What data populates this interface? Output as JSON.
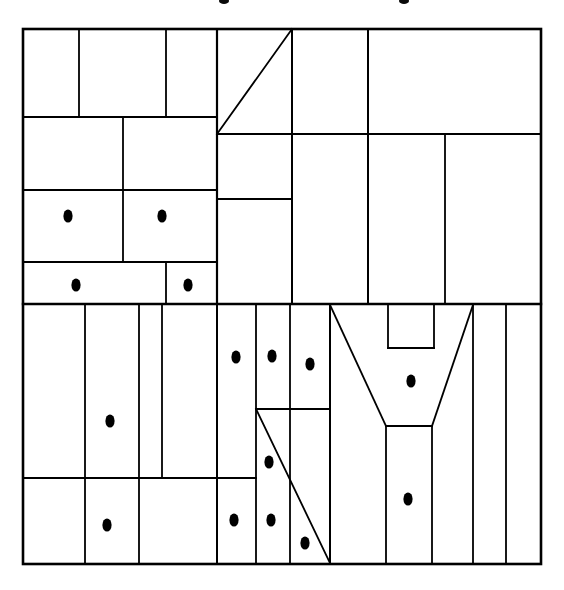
{
  "figure": {
    "title": "",
    "canvas": {
      "width": 564,
      "height": 590
    },
    "colors": {
      "background": "#ffffff",
      "line": "#000000",
      "marker": "#000000"
    },
    "line_weights": {
      "outer_border": 2.6,
      "major_partition": 2.2,
      "minor_partition": 1.6,
      "diagonal": 1.8
    },
    "plan_bounds": {
      "left": 23,
      "top": 29,
      "right": 541,
      "bottom": 564
    },
    "marker": {
      "shape": "ellipse",
      "semantic": "occupancy-dot",
      "radius_x": 4.6,
      "radius_y": 6.6,
      "count": 15
    },
    "top_artifacts": [
      {
        "name": "cropped-glyph-left",
        "cx": 224,
        "cy": 1,
        "rx": 5,
        "ry": 3
      },
      {
        "name": "cropped-glyph-right",
        "cx": 404,
        "cy": 1,
        "rx": 5,
        "ry": 3
      }
    ],
    "outer_border": {
      "x": 23,
      "y": 29,
      "width": 518,
      "height": 535
    },
    "walls": [
      {
        "name": "wall-h-upper-band-1",
        "x1": 23,
        "y1": 117,
        "x2": 217,
        "y2": 117,
        "w": 2.0
      },
      {
        "name": "wall-h-upper-band-2",
        "x1": 23,
        "y1": 190,
        "x2": 217,
        "y2": 190,
        "w": 2.0
      },
      {
        "name": "wall-h-upper-band-3",
        "x1": 23,
        "y1": 262,
        "x2": 217,
        "y2": 262,
        "w": 2.0
      },
      {
        "name": "wall-h-mid-major",
        "x1": 23,
        "y1": 304,
        "x2": 541,
        "y2": 304,
        "w": 2.4
      },
      {
        "name": "wall-v-tl-a",
        "x1": 79,
        "y1": 29,
        "x2": 79,
        "y2": 117,
        "w": 1.8
      },
      {
        "name": "wall-v-tl-b",
        "x1": 166,
        "y1": 29,
        "x2": 166,
        "y2": 117,
        "w": 1.8
      },
      {
        "name": "wall-v-tl-c",
        "x1": 217,
        "y1": 29,
        "x2": 217,
        "y2": 304,
        "w": 2.2
      },
      {
        "name": "wall-v-tl-d",
        "x1": 123,
        "y1": 117,
        "x2": 123,
        "y2": 262,
        "w": 1.8
      },
      {
        "name": "wall-v-tl-e",
        "x1": 166,
        "y1": 262,
        "x2": 166,
        "y2": 304,
        "w": 1.8
      },
      {
        "name": "wall-v-top-center",
        "x1": 292,
        "y1": 29,
        "x2": 292,
        "y2": 304,
        "w": 2.0
      },
      {
        "name": "wall-v-top-right-a",
        "x1": 368,
        "y1": 29,
        "x2": 368,
        "y2": 304,
        "w": 2.0
      },
      {
        "name": "wall-v-top-right-b",
        "x1": 445,
        "y1": 134,
        "x2": 445,
        "y2": 304,
        "w": 1.8
      },
      {
        "name": "wall-h-top-center-1",
        "x1": 217,
        "y1": 134,
        "x2": 541,
        "y2": 134,
        "w": 2.0
      },
      {
        "name": "wall-h-top-center-2",
        "x1": 217,
        "y1": 199,
        "x2": 292,
        "y2": 199,
        "w": 1.8
      },
      {
        "name": "wall-v-bl-a",
        "x1": 85,
        "y1": 304,
        "x2": 85,
        "y2": 564,
        "w": 1.8
      },
      {
        "name": "wall-v-bl-b",
        "x1": 139,
        "y1": 304,
        "x2": 139,
        "y2": 478,
        "w": 1.8
      },
      {
        "name": "wall-v-bl-c",
        "x1": 162,
        "y1": 304,
        "x2": 162,
        "y2": 478,
        "w": 1.8
      },
      {
        "name": "wall-v-bl-d",
        "x1": 139,
        "y1": 478,
        "x2": 139,
        "y2": 564,
        "w": 1.8
      },
      {
        "name": "wall-h-bl-lower",
        "x1": 23,
        "y1": 478,
        "x2": 217,
        "y2": 478,
        "w": 2.0
      },
      {
        "name": "wall-v-bc-a",
        "x1": 217,
        "y1": 304,
        "x2": 217,
        "y2": 564,
        "w": 2.0
      },
      {
        "name": "wall-v-bc-b",
        "x1": 256,
        "y1": 304,
        "x2": 256,
        "y2": 564,
        "w": 1.8
      },
      {
        "name": "wall-v-bc-c",
        "x1": 290,
        "y1": 304,
        "x2": 290,
        "y2": 564,
        "w": 1.8
      },
      {
        "name": "wall-h-bc-1",
        "x1": 256,
        "y1": 409,
        "x2": 330,
        "y2": 409,
        "w": 1.8
      },
      {
        "name": "wall-h-bc-2",
        "x1": 217,
        "y1": 478,
        "x2": 256,
        "y2": 478,
        "w": 1.8
      },
      {
        "name": "wall-v-bc-d",
        "x1": 330,
        "y1": 304,
        "x2": 330,
        "y2": 564,
        "w": 2.0
      },
      {
        "name": "wall-v-br-notch-left",
        "x1": 388,
        "y1": 304,
        "x2": 388,
        "y2": 348,
        "w": 1.8
      },
      {
        "name": "wall-v-br-notch-right",
        "x1": 434,
        "y1": 304,
        "x2": 434,
        "y2": 348,
        "w": 1.8
      },
      {
        "name": "wall-h-br-notch-bottom",
        "x1": 388,
        "y1": 348,
        "x2": 434,
        "y2": 348,
        "w": 1.8
      },
      {
        "name": "wall-h-br-stem-top",
        "x1": 386,
        "y1": 426,
        "x2": 432,
        "y2": 426,
        "w": 1.8
      },
      {
        "name": "wall-v-br-stem-left",
        "x1": 386,
        "y1": 426,
        "x2": 386,
        "y2": 564,
        "w": 1.8
      },
      {
        "name": "wall-v-br-stem-right",
        "x1": 432,
        "y1": 426,
        "x2": 432,
        "y2": 564,
        "w": 1.8
      },
      {
        "name": "wall-v-br-a",
        "x1": 473,
        "y1": 304,
        "x2": 473,
        "y2": 564,
        "w": 1.8
      },
      {
        "name": "wall-v-br-b",
        "x1": 506,
        "y1": 304,
        "x2": 506,
        "y2": 564,
        "w": 1.8
      }
    ],
    "diagonals": [
      {
        "name": "diagonal-top-triangle",
        "x1": 217,
        "y1": 134,
        "x2": 292,
        "y2": 29,
        "w": 1.8
      },
      {
        "name": "diagonal-bottom-long",
        "x1": 256,
        "y1": 409,
        "x2": 330,
        "y2": 563,
        "w": 1.8
      },
      {
        "name": "diagonal-funnel-left",
        "x1": 330,
        "y1": 305,
        "x2": 386,
        "y2": 426,
        "w": 1.8
      },
      {
        "name": "diagonal-funnel-right",
        "x1": 473,
        "y1": 305,
        "x2": 432,
        "y2": 426,
        "w": 1.8
      }
    ],
    "markers": [
      {
        "id": 1,
        "name": "dot-upper-left-room",
        "cx": 68,
        "cy": 216
      },
      {
        "id": 2,
        "name": "dot-upper-center-room",
        "cx": 162,
        "cy": 216
      },
      {
        "id": 3,
        "name": "dot-upper-strip-left",
        "cx": 76,
        "cy": 285
      },
      {
        "id": 4,
        "name": "dot-upper-strip-right",
        "cx": 188,
        "cy": 285
      },
      {
        "id": 5,
        "name": "dot-lower-left-tall-room",
        "cx": 110,
        "cy": 421
      },
      {
        "id": 6,
        "name": "dot-lower-left-bottom-room",
        "cx": 107,
        "cy": 525
      },
      {
        "id": 7,
        "name": "dot-mid-bottom-a",
        "cx": 236,
        "cy": 357
      },
      {
        "id": 8,
        "name": "dot-mid-bottom-b",
        "cx": 272,
        "cy": 356
      },
      {
        "id": 9,
        "name": "dot-mid-bottom-c",
        "cx": 310,
        "cy": 364
      },
      {
        "id": 10,
        "name": "dot-mid-triangle-room",
        "cx": 269,
        "cy": 462
      },
      {
        "id": 11,
        "name": "dot-bottom-row-a",
        "cx": 234,
        "cy": 520
      },
      {
        "id": 12,
        "name": "dot-bottom-row-b",
        "cx": 271,
        "cy": 520
      },
      {
        "id": 13,
        "name": "dot-bottom-row-c",
        "cx": 305,
        "cy": 543
      },
      {
        "id": 14,
        "name": "dot-funnel-upper",
        "cx": 411,
        "cy": 381
      },
      {
        "id": 15,
        "name": "dot-funnel-stem",
        "cx": 408,
        "cy": 499
      }
    ]
  }
}
